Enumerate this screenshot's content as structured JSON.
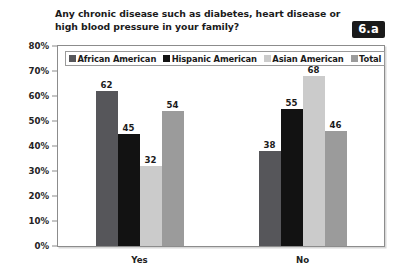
{
  "badge": {
    "label": "6.a"
  },
  "title": {
    "line1": "Any chronic disease such as diabetes, heart disease or",
    "line2": "high blood pressure in your family?"
  },
  "chart_data": {
    "type": "bar",
    "title": "Any chronic disease such as diabetes, heart disease or high blood pressure in your family?",
    "xlabel": "",
    "ylabel": "",
    "ylim": [
      0,
      80
    ],
    "grid": false,
    "legend_position": "top-left-inside",
    "categories": [
      "Yes",
      "No"
    ],
    "ytick_labels": [
      "0%",
      "10%",
      "20%",
      "30%",
      "40%",
      "50%",
      "60%",
      "70%",
      "80%"
    ],
    "ytick_values": [
      0,
      10,
      20,
      30,
      40,
      50,
      60,
      70,
      80
    ],
    "series": [
      {
        "name": "African American",
        "color": "#56565a",
        "values": [
          62,
          38
        ]
      },
      {
        "name": "Hispanic American",
        "color": "#121212",
        "values": [
          45,
          55
        ]
      },
      {
        "name": "Asian American",
        "color": "#cbcbcb",
        "values": [
          32,
          68
        ]
      },
      {
        "name": "Total",
        "color": "#9b9b9b",
        "values": [
          54,
          46
        ]
      }
    ]
  }
}
